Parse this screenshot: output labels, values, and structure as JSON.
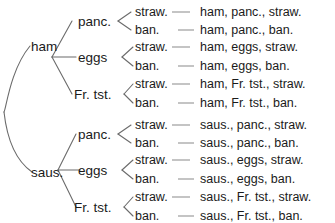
{
  "diagram": {
    "colors": {
      "background": "#ffffff",
      "text": "#1a1a1a",
      "edge": "#6b6b6b",
      "dash": "#8a8a8a"
    },
    "level1": [
      {
        "label": "ham"
      },
      {
        "label": "saus."
      }
    ],
    "level2": [
      {
        "label": "panc."
      },
      {
        "label": "eggs"
      },
      {
        "label": "Fr. tst."
      },
      {
        "label": "panc."
      },
      {
        "label": "eggs"
      },
      {
        "label": "Fr. tst."
      }
    ],
    "leaves": [
      {
        "label": "straw.",
        "outcome": "ham, panc., straw."
      },
      {
        "label": "ban.",
        "outcome": "ham, panc., ban."
      },
      {
        "label": "straw.",
        "outcome": "ham, eggs, straw."
      },
      {
        "label": "ban.",
        "outcome": "ham, eggs, ban."
      },
      {
        "label": "straw.",
        "outcome": "ham, Fr. tst., straw."
      },
      {
        "label": "ban.",
        "outcome": "ham, Fr. tst., ban."
      },
      {
        "label": "straw.",
        "outcome": "saus., panc., straw."
      },
      {
        "label": "ban.",
        "outcome": "saus., panc., ban."
      },
      {
        "label": "straw.",
        "outcome": "saus., eggs, straw."
      },
      {
        "label": "ban.",
        "outcome": "saus., eggs, ban."
      },
      {
        "label": "straw.",
        "outcome": "saus., Fr. tst., straw."
      },
      {
        "label": "ban.",
        "outcome": "saus., Fr. tst., ban."
      }
    ]
  }
}
